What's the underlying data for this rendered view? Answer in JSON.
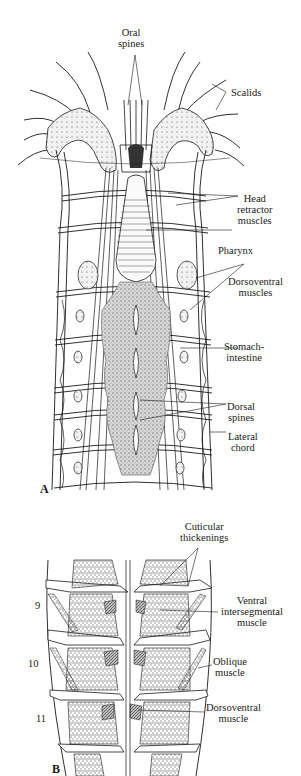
{
  "figure": {
    "panels": [
      {
        "id": "A",
        "letter": "A",
        "labels": {
          "oral_spines": [
            "Oral",
            "spines"
          ],
          "scalids": [
            "Scalids"
          ],
          "head_retractor_muscles": [
            "Head",
            "retractor",
            "muscles"
          ],
          "pharynx": [
            "Pharynx"
          ],
          "dorsoventral_muscles": [
            "Dorsoventral",
            "muscles"
          ],
          "stomach_intestine": [
            "Stomach-",
            "intestine"
          ],
          "dorsal_spines": [
            "Dorsal",
            "spines"
          ],
          "lateral_chord": [
            "Lateral",
            "chord"
          ]
        }
      },
      {
        "id": "B",
        "letter": "B",
        "segment_numbers": [
          "9",
          "10",
          "11"
        ],
        "labels": {
          "cuticular_thickenings": [
            "Cuticular",
            "thickenings"
          ],
          "ventral_intersegmental_muscle": [
            "Ventral",
            "intersegmental",
            "muscle"
          ],
          "oblique_muscle": [
            "Oblique",
            "muscle"
          ],
          "dorsoventral_muscle": [
            "Dorsoventral",
            "muscle"
          ]
        }
      }
    ],
    "colors": {
      "ink": "#1a1a1a",
      "stipple": "#8a8a8a",
      "gut_fill": "#9a9a9a",
      "background": "#ffffff"
    }
  }
}
